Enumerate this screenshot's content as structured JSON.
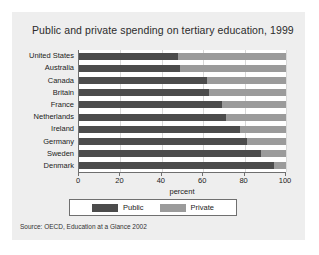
{
  "chart_data": {
    "type": "bar",
    "orientation": "horizontal",
    "stacked": true,
    "title": "Public and private spending on tertiary education, 1999",
    "xlabel": "percent",
    "ylabel": "",
    "xlim": [
      0,
      100
    ],
    "xticks": [
      0,
      20,
      40,
      60,
      80,
      100
    ],
    "grid": true,
    "legend_position": "bottom",
    "categories": [
      "United States",
      "Australia",
      "Canada",
      "Britain",
      "France",
      "Netherlands",
      "Ireland",
      "Germany",
      "Sweden",
      "Denmark"
    ],
    "series": [
      {
        "name": "Public",
        "color": "#4c4c4c",
        "values": [
          48,
          49,
          62,
          63,
          69,
          71,
          78,
          81,
          88,
          94
        ]
      },
      {
        "name": "Private",
        "color": "#9b9b9b",
        "values": [
          52,
          51,
          38,
          37,
          31,
          29,
          22,
          19,
          12,
          6
        ]
      }
    ]
  },
  "source": {
    "note": "Source:  OECD, Education at a Glance 2002"
  },
  "colors": {
    "figure_background": "#eeeeee",
    "plot_background": "#ffffff",
    "axis": "#6f6f6f",
    "gridline": "#d8d8d8",
    "public": "#4c4c4c",
    "private": "#9b9b9b"
  }
}
